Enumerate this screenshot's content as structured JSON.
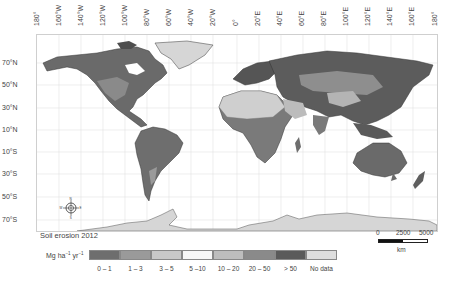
{
  "figure": {
    "title": "Soil erosion 2012",
    "units": {
      "base": "Mg ha",
      "exp1": "−1",
      "mid": " yr",
      "exp2": "−1"
    }
  },
  "axes": {
    "longitude_labels": [
      "180°",
      "160°W",
      "140°W",
      "120°W",
      "100°W",
      "80°W",
      "60°W",
      "40°W",
      "20°W",
      "0°",
      "20°E",
      "40°E",
      "60°E",
      "80°E",
      "100°E",
      "120°E",
      "140°E",
      "160°E",
      "180°"
    ],
    "latitude_labels": [
      "70°N",
      "50°N",
      "30°N",
      "10°N",
      "10°S",
      "30°S",
      "50°S",
      "70°S"
    ]
  },
  "legend": {
    "classes": [
      {
        "label": "0 – 1",
        "color": "#6e6e6e"
      },
      {
        "label": "1 – 3",
        "color": "#9a9a9a"
      },
      {
        "label": "3 – 5",
        "color": "#c8c8c8"
      },
      {
        "label": "5 –10",
        "color": "#f7f7f7"
      },
      {
        "label": "10 – 20",
        "color": "#bdbdbd"
      },
      {
        "label": "20 – 50",
        "color": "#8a8a8a"
      },
      {
        "label": "> 50",
        "color": "#5a5a5a"
      },
      {
        "label": "No data",
        "color": "#dedede"
      }
    ]
  },
  "scale_bar": {
    "ticks": [
      "0",
      "2500",
      "5000"
    ],
    "unit": "km"
  },
  "compass": {
    "n": "N",
    "s": "S",
    "e": "E",
    "w": "W"
  },
  "colors": {
    "land_dark": "#555555",
    "land_mid": "#7a7a7a",
    "land_light": "#a8a8a8",
    "no_data": "#d9d9d9",
    "grid": "#dddddd"
  }
}
